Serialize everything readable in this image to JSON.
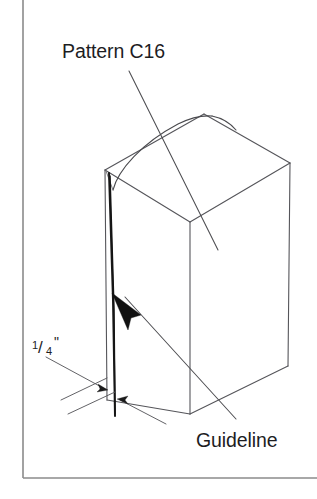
{
  "figure": {
    "kind": "technical-line-drawing",
    "background_color": "#ffffff",
    "frame_color": "#8b8b8b",
    "line_color": "#55555a",
    "heavy_line_color": "#1a1a1a",
    "text_color": "#1d1d1f"
  },
  "labels": {
    "pattern": "Pattern C16",
    "guideline": "Guideline"
  },
  "dimension": {
    "numerator": "1",
    "slash": "/",
    "denominator": "4",
    "unit_mark": "\"",
    "full_text": "1/4\""
  },
  "annotations": [
    {
      "name": "pattern-callout",
      "text": "Pattern C16",
      "points_to": "top-face-pattern-curve"
    },
    {
      "name": "guideline-callout",
      "text": "Guideline",
      "points_to": "front-face-vertical-guideline"
    },
    {
      "name": "quarter-inch-dimension",
      "text": "1/4\"",
      "points_to": "offset-gap-at-box-base"
    }
  ],
  "geometry": {
    "box_vertices": {
      "top_left": [
        105,
        170
      ],
      "top_back": [
        204,
        114
      ],
      "top_right": [
        290,
        163
      ],
      "top_front": [
        190,
        222
      ],
      "bottom_left": [
        107,
        400
      ],
      "bottom_front": [
        190,
        414
      ],
      "bottom_right": [
        288,
        366
      ]
    },
    "guideline_start": [
      108,
      172
    ],
    "guideline_end": [
      114,
      416
    ]
  }
}
